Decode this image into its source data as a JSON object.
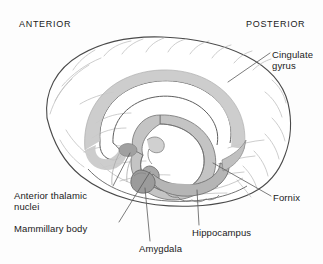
{
  "figure": {
    "background_color": "#fdfdfd"
  },
  "orientation": {
    "anterior": "ANTERIOR",
    "posterior": "POSTERIOR"
  },
  "labels": {
    "cingulate_gyrus": "Cingulate\ngyrus",
    "fornix": "Fornix",
    "anterior_thalamic_nuclei": "Anterior thalamic\nnuclei",
    "mammillary_body": "Mammillary body",
    "amygdala": "Amygdala",
    "hippocampus": "Hippocampus"
  },
  "colors": {
    "outline": "#4a4a4a",
    "sulci": "#b9b9b9",
    "highlight_light": "#c9c9c9",
    "highlight_mid": "#b0b0b0",
    "highlight_dark": "#9a9a9a",
    "leader_line": "#5a5a5a",
    "text": "#1a1a1a",
    "background": "#fdfdfd"
  }
}
